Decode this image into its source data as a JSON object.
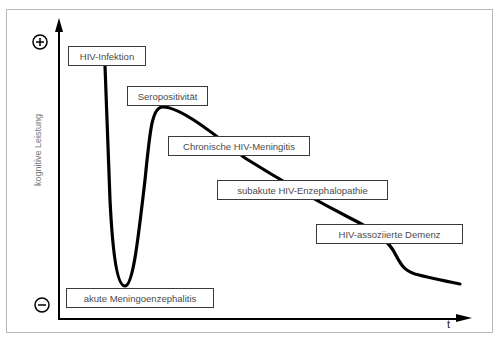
{
  "diagram": {
    "title": "",
    "y_axis": {
      "label": "kognitive Leistung",
      "top_symbol": "plus-circle",
      "bottom_symbol": "minus-circle"
    },
    "x_axis": {
      "label": "t"
    },
    "stages": [
      {
        "id": "hiv-infektion",
        "label": "HIV-Infektion"
      },
      {
        "id": "seropositivitaet",
        "label": "Seropositivität"
      },
      {
        "id": "chronische-meningitis",
        "label": "Chronische HIV-Meningitis"
      },
      {
        "id": "subakute-enzephalopathie",
        "label": "subakute HIV-Enzephalopathie"
      },
      {
        "id": "assoziierte-demenz",
        "label": "HIV-assoziierte Demenz"
      },
      {
        "id": "akute-meningoenzephalitis",
        "label": "akute Meningoenzephalitis"
      }
    ],
    "curve_description": "Cognitive performance over time: sharp drop after HIV infection to acute meningoencephalitis, recovery to seropositivity peak, then progressive decline through chronic meningitis, subacute encephalopathy, to HIV-associated dementia.",
    "colors": {
      "line": "#000000",
      "box_border": "#3a3a3a",
      "text": "#4a4a4a",
      "frame": "#b8b8b8"
    }
  }
}
